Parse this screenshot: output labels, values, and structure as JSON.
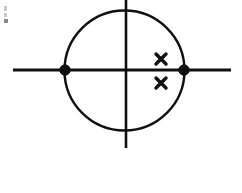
{
  "figure": {
    "kind": "geometry-diagram",
    "title": "Circle centered on coordinate axes with two marked intersection points and two cross marks",
    "background_color": "#ffffff",
    "ink_color": "#101010",
    "canvas": {
      "width": 242,
      "height": 193
    }
  },
  "axes": {
    "horizontal": {
      "label": "horizontal-axis",
      "x1": 13,
      "y1": 70,
      "x2": 231,
      "y2": 70,
      "stroke_width": 3.0
    },
    "vertical": {
      "label": "vertical-axis",
      "x1": 126,
      "y1": 0,
      "x2": 126,
      "y2": 148,
      "stroke_width": 2.6
    },
    "origin": {
      "label": "origin",
      "x": 126,
      "y": 70
    }
  },
  "circle": {
    "label": "circle",
    "cx": 124.5,
    "cy": 70.5,
    "rx": 60,
    "ry": 60,
    "stroke_width": 2.4
  },
  "points": [
    {
      "name": "left-intersection-point",
      "label": "left intersection of circle and horizontal axis",
      "x": 65,
      "y": 70,
      "radius": 5.2
    },
    {
      "name": "right-intersection-point",
      "label": "right intersection of circle and horizontal axis",
      "x": 184,
      "y": 70,
      "radius": 5.2
    }
  ],
  "cross_marks": [
    {
      "name": "upper-cross-mark",
      "label": "x",
      "x": 161,
      "y": 59,
      "arm": 5.0,
      "stroke_width": 3.4
    },
    {
      "name": "lower-cross-mark",
      "label": "x",
      "x": 161,
      "y": 83,
      "arm": 5.0,
      "stroke_width": 3.4
    }
  ],
  "artifacts": [
    {
      "name": "scan-speck-upper",
      "x": 4,
      "y": 6,
      "width": 3,
      "height": 5,
      "tone": "light"
    },
    {
      "name": "scan-speck-middle",
      "x": 4,
      "y": 13,
      "width": 3,
      "height": 4,
      "tone": "light"
    },
    {
      "name": "scan-speck-lower",
      "x": 4,
      "y": 19,
      "width": 4,
      "height": 4,
      "tone": "dark"
    }
  ]
}
